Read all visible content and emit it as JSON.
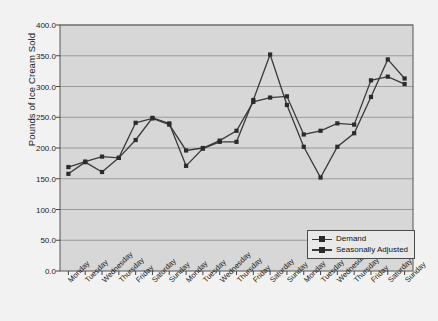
{
  "chart_data": {
    "type": "line",
    "title": "",
    "xlabel": "",
    "ylabel": "Pounds of Ice Cream Sold",
    "ylim": [
      0,
      400
    ],
    "ytick_step": 50,
    "ytick_labels": [
      "0.0",
      "50.0",
      "100.0",
      "150.0",
      "200.0",
      "250.0",
      "300.0",
      "350.0",
      "400.0"
    ],
    "grid": "horizontal",
    "legend_position": "bottom-right",
    "plot_background": "#d7d7d7",
    "line_color": "#3a3a3a",
    "marker_color": "#2b2b2b",
    "categories": [
      "Monday",
      "Tuesday",
      "Wednesday",
      "Thursday",
      "Friday",
      "Saturday",
      "Sunday",
      "Monday",
      "Tuesday",
      "Wednesday",
      "Thursday",
      "Friday",
      "Saturday",
      "Sunday",
      "Monday",
      "Tuesday",
      "Wednesday",
      "Thursday",
      "Friday",
      "Saturday",
      "Sunday"
    ],
    "series": [
      {
        "name": "Demand",
        "values": [
          158,
          177,
          161,
          184,
          213,
          249,
          240,
          171,
          199,
          210,
          210,
          278,
          352,
          270,
          202,
          152,
          202,
          224,
          283,
          344,
          313
        ]
      },
      {
        "name": "Seasonally Adjusted",
        "values": [
          169,
          178,
          186,
          184,
          241,
          248,
          238,
          196,
          200,
          212,
          228,
          275,
          282,
          284,
          222,
          228,
          240,
          238,
          310,
          316,
          304
        ]
      }
    ]
  },
  "legend": {
    "entries": [
      {
        "label": "Demand"
      },
      {
        "label": "Seasonally Adjusted"
      }
    ]
  },
  "axes": {
    "y_title": "Pounds of Ice Cream Sold"
  }
}
